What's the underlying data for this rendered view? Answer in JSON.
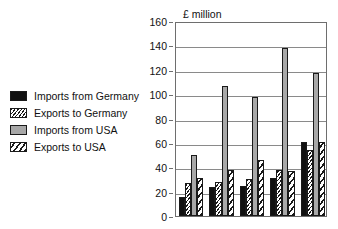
{
  "chart_data": {
    "type": "bar",
    "title": "",
    "axis_title": "£ million",
    "xlabel": "",
    "ylabel": "£ million",
    "ylim": [
      0,
      160
    ],
    "ytick_step": 20,
    "yticks": [
      "0",
      "20",
      "40",
      "60",
      "80",
      "100",
      "120",
      "140",
      "160"
    ],
    "grid": true,
    "legend_position": "left",
    "categories": [
      "1",
      "2",
      "3",
      "4",
      "5"
    ],
    "xtick_labels_visible": false,
    "series": [
      {
        "name": "Imports from Germany",
        "fill": "solid-black",
        "color": "#111111",
        "values": [
          16,
          24,
          25,
          31,
          61
        ]
      },
      {
        "name": "Exports to Germany",
        "fill": "hatch-fine",
        "color": "#1a1a1a",
        "values": [
          27,
          28,
          30,
          38,
          54
        ]
      },
      {
        "name": "Imports from USA",
        "fill": "solid-gray",
        "color": "#a8a8a8",
        "values": [
          50,
          107,
          98,
          138,
          117
        ]
      },
      {
        "name": "Exports to USA",
        "fill": "hatch-coarse",
        "color": "#1a1a1a",
        "values": [
          31,
          38,
          46,
          37,
          61
        ]
      }
    ]
  },
  "legend": {
    "items": [
      {
        "label": "Imports from Germany",
        "fill": "solid-black"
      },
      {
        "label": "Exports to Germany",
        "fill": "hatch-fine"
      },
      {
        "label": "Imports from USA",
        "fill": "solid-gray"
      },
      {
        "label": "Exports to USA",
        "fill": "hatch-coarse"
      }
    ]
  }
}
